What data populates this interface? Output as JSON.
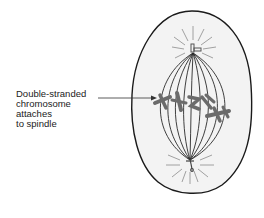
{
  "diagram": {
    "label": {
      "lines": [
        "Double-stranded",
        "chromosome",
        "attaches",
        "to spindle"
      ]
    },
    "colors": {
      "cell_outline": "#1a1a1a",
      "cell_fill": "#f3f3f3",
      "spindle": "#2a2a2a",
      "chromosome": "#6b6b6b",
      "aster": "#8a8a8a",
      "text": "#222222"
    },
    "parts": [
      "cell-membrane",
      "spindle-fibers",
      "upper-centrosome",
      "lower-centrosome",
      "chromosomes",
      "pointer-arrow"
    ]
  }
}
